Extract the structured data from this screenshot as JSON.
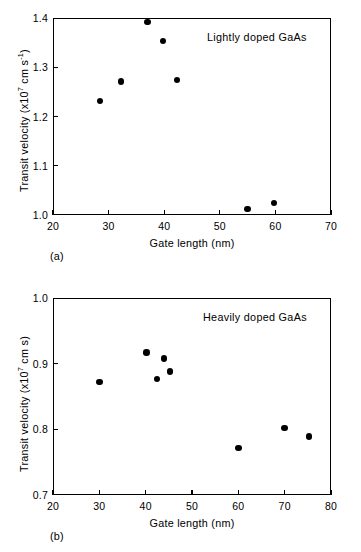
{
  "figure": {
    "panels": [
      {
        "caption": "(a)",
        "annotation": "Lightly doped GaAs",
        "chart": {
          "type": "scatter",
          "title": "",
          "xlabel": "Gate length (nm)",
          "ylabel_prefix": "Transit velocity (x10",
          "ylabel_exp": "7",
          "ylabel_mid": " cm s",
          "ylabel_exp2": "-1",
          "ylabel_suffix": ")",
          "ylabel_plain": "Transit velocity (x10^7 cm s^-1)",
          "xlim": [
            20,
            70
          ],
          "ylim": [
            1.0,
            1.4
          ],
          "xticks": [
            20,
            30,
            40,
            50,
            60,
            70
          ],
          "xticklabels": [
            "20",
            "30",
            "40",
            "50",
            "60",
            "70"
          ],
          "yticks": [
            1.0,
            1.1,
            1.2,
            1.3,
            1.4
          ],
          "yticklabels": [
            "1.0",
            "1.1",
            "1.2",
            "1.3",
            "1.4"
          ],
          "grid": false,
          "legend": "none",
          "x": [
            28.5,
            32.2,
            37.0,
            39.8,
            42.3,
            55.0,
            59.8
          ],
          "y": [
            1.231,
            1.271,
            1.392,
            1.353,
            1.274,
            1.012,
            1.025
          ],
          "marker": "filled-circle",
          "marker_color": "#000000"
        }
      },
      {
        "caption": "(b)",
        "annotation": "Heavily doped GaAs",
        "chart": {
          "type": "scatter",
          "title": "",
          "xlabel": "Gate length (nm)",
          "ylabel_prefix": "Transit velocity (x10",
          "ylabel_exp": "7",
          "ylabel_mid": " cm s",
          "ylabel_exp2": "",
          "ylabel_suffix": ")",
          "ylabel_plain": "Transit velocity (x10^7 cm s)",
          "xlim": [
            20,
            80
          ],
          "ylim": [
            0.7,
            1.0
          ],
          "xticks": [
            20,
            30,
            40,
            50,
            60,
            70,
            80
          ],
          "xticklabels": [
            "20",
            "30",
            "40",
            "50",
            "60",
            "70",
            "80"
          ],
          "yticks": [
            0.7,
            0.8,
            0.9,
            1.0
          ],
          "yticklabels": [
            "0.7",
            "0.8",
            "0.9",
            "1.0"
          ],
          "grid": false,
          "legend": "none",
          "x": [
            30.0,
            40.2,
            42.5,
            44.0,
            45.2,
            60.0,
            70.0,
            75.2
          ],
          "y": [
            0.872,
            0.917,
            0.877,
            0.908,
            0.888,
            0.772,
            0.802,
            0.789
          ],
          "marker": "filled-circle",
          "marker_color": "#000000"
        }
      }
    ]
  },
  "chart_data": [
    {
      "type": "scatter",
      "title": "Lightly doped GaAs",
      "xlabel": "Gate length (nm)",
      "ylabel": "Transit velocity (x10^7 cm s^-1)",
      "xlim": [
        20,
        70
      ],
      "ylim": [
        1.0,
        1.4
      ],
      "xticks": [
        20,
        30,
        40,
        50,
        60,
        70
      ],
      "yticks": [
        1.0,
        1.1,
        1.2,
        1.3,
        1.4
      ],
      "grid": false,
      "legend": "none",
      "points": [
        {
          "x": 28.5,
          "y": 1.231
        },
        {
          "x": 32.2,
          "y": 1.271
        },
        {
          "x": 37.0,
          "y": 1.392
        },
        {
          "x": 39.8,
          "y": 1.353
        },
        {
          "x": 42.3,
          "y": 1.274
        },
        {
          "x": 55.0,
          "y": 1.012
        },
        {
          "x": 59.8,
          "y": 1.025
        }
      ]
    },
    {
      "type": "scatter",
      "title": "Heavily doped GaAs",
      "xlabel": "Gate length (nm)",
      "ylabel": "Transit velocity (x10^7 cm s)",
      "xlim": [
        20,
        80
      ],
      "ylim": [
        0.7,
        1.0
      ],
      "xticks": [
        20,
        30,
        40,
        50,
        60,
        70,
        80
      ],
      "yticks": [
        0.7,
        0.8,
        0.9,
        1.0
      ],
      "grid": false,
      "legend": "none",
      "points": [
        {
          "x": 30.0,
          "y": 0.872
        },
        {
          "x": 40.2,
          "y": 0.917
        },
        {
          "x": 42.5,
          "y": 0.877
        },
        {
          "x": 44.0,
          "y": 0.908
        },
        {
          "x": 45.2,
          "y": 0.888
        },
        {
          "x": 60.0,
          "y": 0.772
        },
        {
          "x": 70.0,
          "y": 0.802
        },
        {
          "x": 75.2,
          "y": 0.789
        }
      ]
    }
  ]
}
